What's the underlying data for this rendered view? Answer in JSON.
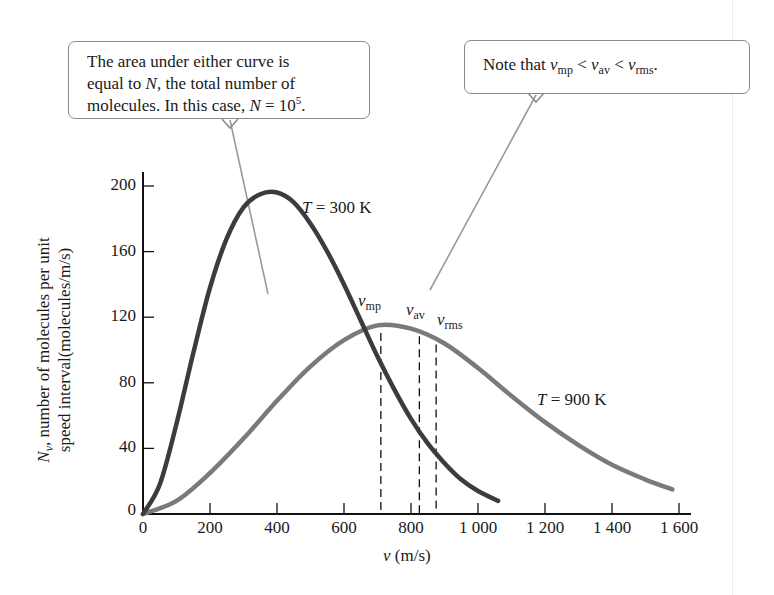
{
  "chart_data": {
    "type": "line",
    "title": "",
    "xlabel": "v (m/s)",
    "ylabel": "N_v, number of molecules per unit speed interval(molecules/m/s)",
    "xlim": [
      0,
      1600
    ],
    "ylim": [
      0,
      200
    ],
    "x_ticks": [
      0,
      200,
      400,
      600,
      800,
      1000,
      1200,
      1400,
      1600
    ],
    "x_tick_labels": [
      "0",
      "200",
      "400",
      "600",
      "800",
      "1 000",
      "1 200",
      "1 400",
      "1 600"
    ],
    "y_ticks": [
      0,
      40,
      80,
      120,
      160,
      200
    ],
    "y_tick_labels": [
      "0",
      "40",
      "80",
      "120",
      "160",
      "200"
    ],
    "grid": false,
    "legend": "none (curves labeled inline)",
    "series": [
      {
        "name": "T = 300 K",
        "color": "#3c3c3c",
        "x": [
          0,
          50,
          100,
          150,
          200,
          250,
          300,
          350,
          400,
          450,
          500,
          550,
          600,
          650,
          700,
          750,
          800,
          850,
          900,
          950,
          1000,
          1060
        ],
        "values": [
          0,
          18,
          55,
          98,
          138,
          168,
          187,
          195,
          196,
          190,
          177,
          160,
          140,
          118,
          96,
          76,
          58,
          43,
          31,
          21,
          14,
          8
        ]
      },
      {
        "name": "T = 900 K",
        "color": "#7a7a7a",
        "x": [
          0,
          100,
          200,
          300,
          400,
          500,
          600,
          700,
          800,
          900,
          1000,
          1100,
          1200,
          1300,
          1400,
          1500,
          1580
        ],
        "values": [
          0,
          8,
          25,
          46,
          69,
          90,
          106,
          115,
          113,
          104,
          89,
          72,
          56,
          42,
          30,
          21,
          15
        ]
      }
    ],
    "reference_lines": [
      {
        "label": "v_mp",
        "x": 710,
        "style": "dashed",
        "y_top": 114
      },
      {
        "label": "v_av",
        "x": 825,
        "style": "dashed",
        "y_top": 112
      },
      {
        "label": "v_rms",
        "x": 875,
        "style": "dashed",
        "y_top": 107
      }
    ],
    "annotations": [
      "The area under either curve is equal to N, the total number of molecules. In this case, N = 10^5.",
      "Note that v_mp < v_av < v_rms."
    ]
  },
  "callouts": {
    "area": {
      "line1": "The area under either curve is",
      "line2_pre": "equal to ",
      "line2_var": "N",
      "line2_post": ", the total number of",
      "line3_pre": "molecules. In this case, ",
      "line3_var": "N",
      "line3_eq": " = 10",
      "line3_exp": "5",
      "line3_end": "."
    },
    "note": {
      "pre": "Note that ",
      "v": "v",
      "mp": "mp",
      "lt": " < ",
      "av": "av",
      "rms": "rms",
      "end": "."
    }
  },
  "labels": {
    "t300_var": "T",
    "t300_rest": " = 300 K",
    "t900_var": "T",
    "t900_rest": " = 900 K",
    "v": "v",
    "mp": "mp",
    "av": "av",
    "rms": "rms",
    "xlabel_var": "v",
    "xlabel_unit": " (m/s)",
    "ylabel_var": "N",
    "ylabel_sub": "v",
    "ylabel_line1_rest": ", number of molecules per unit",
    "ylabel_line2": "speed interval(molecules/m/s)"
  }
}
